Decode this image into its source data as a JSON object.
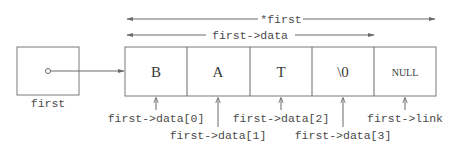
{
  "diagram": {
    "pointer": {
      "label": "first"
    },
    "struct": {
      "cells": [
        {
          "value": "B",
          "label": "first->data[0]"
        },
        {
          "value": "A",
          "label": "first->data[1]"
        },
        {
          "value": "T",
          "label": "first->data[2]"
        },
        {
          "value": "\\0",
          "label": "first->data[3]"
        },
        {
          "value": "NULL",
          "label": "first->link"
        }
      ]
    },
    "spans": {
      "whole": "*first",
      "data": "first->data"
    },
    "colors": {
      "line": "#6a6a6a",
      "text": "#4a4a4a",
      "background": "#ffffff"
    }
  }
}
